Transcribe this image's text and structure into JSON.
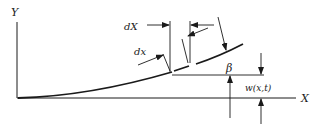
{
  "diagram": {
    "axes": {
      "y_label": "Y",
      "x_label": "X"
    },
    "labels": {
      "dX": "dX",
      "dx": "dx",
      "beta": "β",
      "w": "w(x,t)"
    },
    "colors": {
      "ink": "#1a1a1a",
      "background": "#ffffff"
    }
  }
}
